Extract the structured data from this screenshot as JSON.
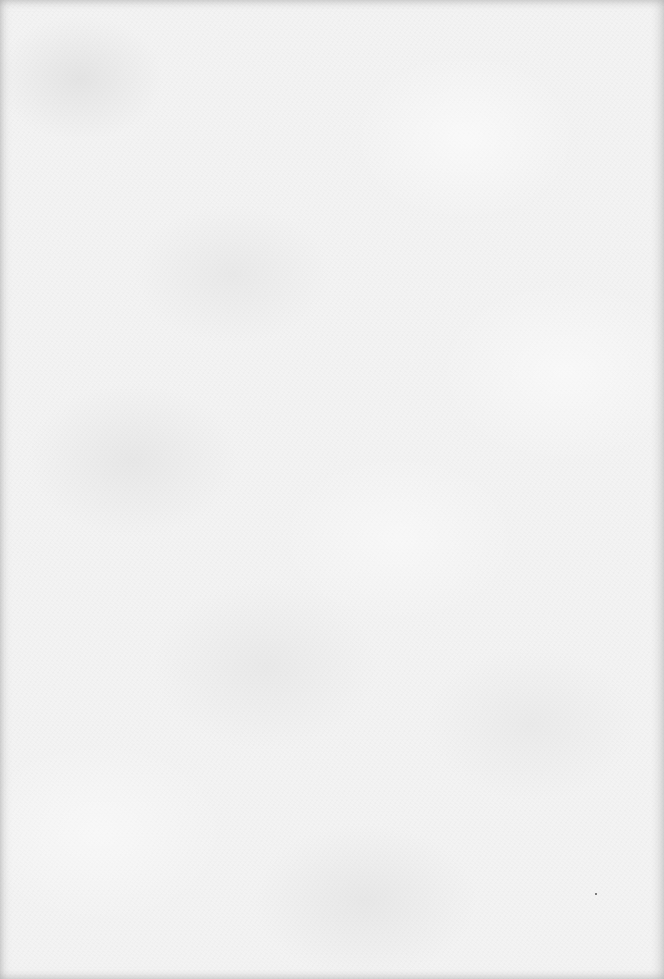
{
  "page": {
    "type": "blank-paper",
    "background_color": "#f3f3f3",
    "edge_shade_color": "#c8c8c8"
  },
  "marks": [
    {
      "kind": "speck",
      "x": 595,
      "y": 893,
      "color": "#555555"
    }
  ]
}
